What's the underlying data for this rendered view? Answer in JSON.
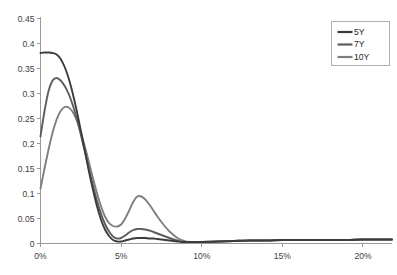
{
  "chart_data": {
    "type": "line",
    "title": "",
    "subtitle": "",
    "xlabel": "",
    "ylabel": "",
    "xlim": [
      0,
      21.8
    ],
    "ylim": [
      0,
      0.45
    ],
    "grid": false,
    "legend_position": "top-right",
    "x_tick_labels": [
      "0%",
      "5%",
      "10%",
      "15%",
      "20%"
    ],
    "x_ticks": [
      0,
      5,
      10,
      15,
      20
    ],
    "y_tick_labels": [
      "0",
      "0.05",
      "0.1",
      "0.15",
      "0.2",
      "0.25",
      "0.3",
      "0.35",
      "0.4",
      "0.45"
    ],
    "y_ticks": [
      0,
      0.05,
      0.1,
      0.15,
      0.2,
      0.25,
      0.3,
      0.35,
      0.4,
      0.45
    ],
    "x": [
      0,
      0.25,
      0.5,
      0.75,
      1.0,
      1.25,
      1.5,
      1.75,
      2.0,
      2.25,
      2.5,
      2.75,
      3.0,
      3.25,
      3.5,
      3.75,
      4.0,
      4.25,
      4.5,
      4.75,
      5.0,
      5.25,
      5.5,
      5.75,
      6.0,
      6.25,
      6.5,
      6.75,
      7.0,
      7.25,
      7.5,
      7.75,
      8.0,
      8.25,
      8.5,
      8.75,
      9.0,
      9.5,
      10.0,
      11.0,
      12.0,
      13.0,
      14.0,
      15.0,
      16.0,
      17.0,
      18.0,
      19.0,
      20.0,
      21.0,
      21.8
    ],
    "series": [
      {
        "name": "5Y",
        "color": "#3c3c3c",
        "values": [
          0.381,
          0.382,
          0.382,
          0.381,
          0.378,
          0.369,
          0.353,
          0.33,
          0.3,
          0.265,
          0.226,
          0.186,
          0.145,
          0.108,
          0.075,
          0.048,
          0.028,
          0.015,
          0.007,
          0.004,
          0.004,
          0.006,
          0.008,
          0.01,
          0.011,
          0.011,
          0.011,
          0.01,
          0.01,
          0.009,
          0.008,
          0.007,
          0.006,
          0.005,
          0.004,
          0.003,
          0.003,
          0.003,
          0.003,
          0.004,
          0.005,
          0.006,
          0.006,
          0.007,
          0.007,
          0.007,
          0.007,
          0.007,
          0.008,
          0.008,
          0.008
        ]
      },
      {
        "name": "7Y",
        "color": "#5d5d5d",
        "values": [
          0.214,
          0.265,
          0.305,
          0.326,
          0.331,
          0.326,
          0.315,
          0.299,
          0.277,
          0.25,
          0.218,
          0.184,
          0.149,
          0.116,
          0.086,
          0.06,
          0.039,
          0.024,
          0.014,
          0.01,
          0.011,
          0.016,
          0.022,
          0.027,
          0.029,
          0.029,
          0.028,
          0.026,
          0.023,
          0.02,
          0.017,
          0.014,
          0.011,
          0.008,
          0.006,
          0.004,
          0.003,
          0.003,
          0.003,
          0.004,
          0.005,
          0.006,
          0.006,
          0.007,
          0.007,
          0.007,
          0.007,
          0.007,
          0.008,
          0.008,
          0.008
        ]
      },
      {
        "name": "10Y",
        "color": "#7f7f7f",
        "values": [
          0.11,
          0.15,
          0.188,
          0.222,
          0.248,
          0.265,
          0.273,
          0.272,
          0.263,
          0.246,
          0.222,
          0.194,
          0.163,
          0.131,
          0.101,
          0.075,
          0.054,
          0.041,
          0.035,
          0.034,
          0.038,
          0.05,
          0.066,
          0.083,
          0.094,
          0.094,
          0.088,
          0.078,
          0.066,
          0.054,
          0.043,
          0.033,
          0.024,
          0.017,
          0.011,
          0.007,
          0.004,
          0.003,
          0.003,
          0.004,
          0.005,
          0.006,
          0.006,
          0.007,
          0.007,
          0.007,
          0.007,
          0.007,
          0.008,
          0.008,
          0.008
        ]
      }
    ],
    "legend_entries": [
      {
        "label": "5Y",
        "color": "#3c3c3c"
      },
      {
        "label": "7Y",
        "color": "#5d5d5d"
      },
      {
        "label": "10Y",
        "color": "#7f7f7f"
      }
    ]
  }
}
